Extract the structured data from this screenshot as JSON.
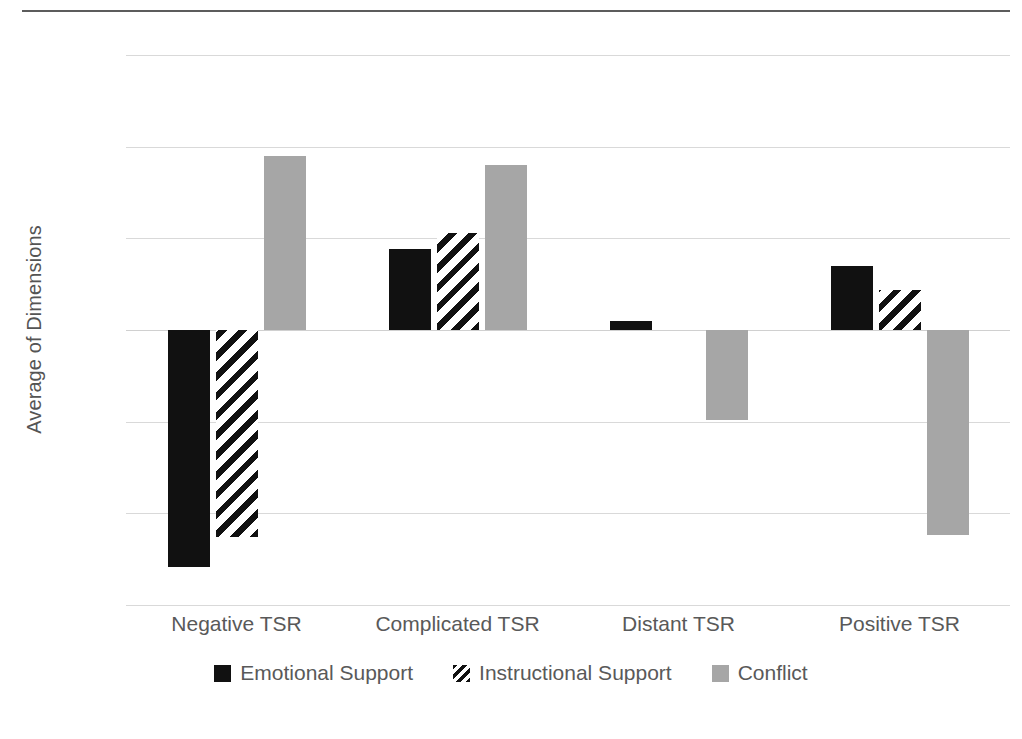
{
  "chart_data": {
    "type": "bar",
    "title": "",
    "xlabel": "",
    "ylabel": "Average of Dimensions",
    "ylim": [
      -1.5,
      1.5
    ],
    "yticks": [
      "1.5",
      "1",
      "0.5",
      "0",
      "-0.5",
      "-1",
      "-1.5"
    ],
    "ytick_values": [
      1.5,
      1,
      0.5,
      0,
      -0.5,
      -1,
      -1.5
    ],
    "grid": true,
    "legend_position": "bottom",
    "categories": [
      "Negative TSR",
      "Complicated TSR",
      "Distant TSR",
      "Positive TSR"
    ],
    "series": [
      {
        "name": "Emotional Support",
        "color": "#111111",
        "pattern": "solid",
        "values": [
          -1.29,
          0.44,
          0.05,
          0.35
        ]
      },
      {
        "name": "Instructional Support",
        "color": "#111111",
        "pattern": "diagonal-hatch",
        "values": [
          -1.13,
          0.53,
          0.0,
          0.22
        ]
      },
      {
        "name": "Conflict",
        "color": "#a6a6a6",
        "pattern": "solid",
        "values": [
          0.95,
          0.9,
          -0.49,
          -1.12
        ]
      }
    ]
  },
  "colors": {
    "emotional_support": "#111111",
    "instructional_support": "#111111",
    "conflict": "#a6a6a6",
    "gridline": "#d9d9d9",
    "text": "#595959",
    "rule": "#5c5c5c"
  }
}
